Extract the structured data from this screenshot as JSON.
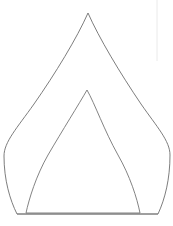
{
  "canvas": {
    "width": 173,
    "height": 226,
    "background_color": "#ffffff",
    "title": "Nested pointed arch outline drawing"
  },
  "style": {
    "outer_stroke_color": "#6e6e6e",
    "inner_stroke_color": "#757575",
    "baseline_stroke_color": "#7a7a7a",
    "faint_guide_color": "#e8e8e8",
    "stroke_width": 0.9,
    "fill": "none"
  },
  "chart_data": {
    "type": "line",
    "xlabel": "",
    "ylabel": "",
    "xlim": [
      0,
      173
    ],
    "ylim": [
      0,
      226
    ],
    "grid": false,
    "legend": "none",
    "series": [
      {
        "name": "outer-arch",
        "closed": true,
        "apex": [
          88,
          13
        ],
        "left_extreme": [
          4,
          146
        ],
        "right_extreme": [
          170,
          145
        ],
        "base_left": [
          17,
          214
        ],
        "base_right": [
          158,
          214
        ],
        "path": "M 88 13 C 77 38 55 74 34 104 C 17 128 4 142 4 156 C 4 180 10 200 17 214 L 158 214 C 165 199 170 179 170 155 C 170 141 157 127 141 104 C 120 73 99 38 88 13 Z"
      },
      {
        "name": "inner-arch",
        "closed": true,
        "apex": [
          87,
          90
        ],
        "base_left": [
          26,
          213
        ],
        "base_right": [
          140,
          213
        ],
        "path": "M 87 90 C 79 104 62 131 48 155 C 36 176 29 199 26 213 L 140 213 C 137 198 130 176 118 155 C 104 130 95 104 87 90 Z"
      },
      {
        "name": "baseline",
        "closed": false,
        "from": [
          17,
          214
        ],
        "to": [
          158,
          214
        ],
        "path": "M 17 214 L 158 214"
      },
      {
        "name": "faint-vertical-guide",
        "closed": false,
        "from": [
          157,
          0
        ],
        "to": [
          157,
          61
        ],
        "path": "M 157 0 L 157 61"
      }
    ]
  }
}
